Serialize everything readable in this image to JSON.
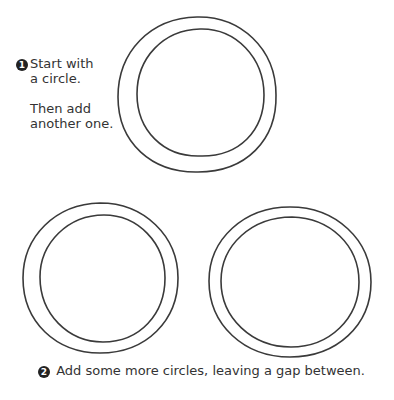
{
  "steps": [
    {
      "number": "1",
      "lines": [
        "Start with",
        "a circle.",
        "Then add",
        "another one."
      ]
    },
    {
      "number": "2",
      "text": "Add some more circles, leaving a gap between."
    }
  ],
  "figure": {
    "ring_count": 3,
    "stroke_color": "#3a3a3a",
    "background_color": "#ffffff"
  }
}
